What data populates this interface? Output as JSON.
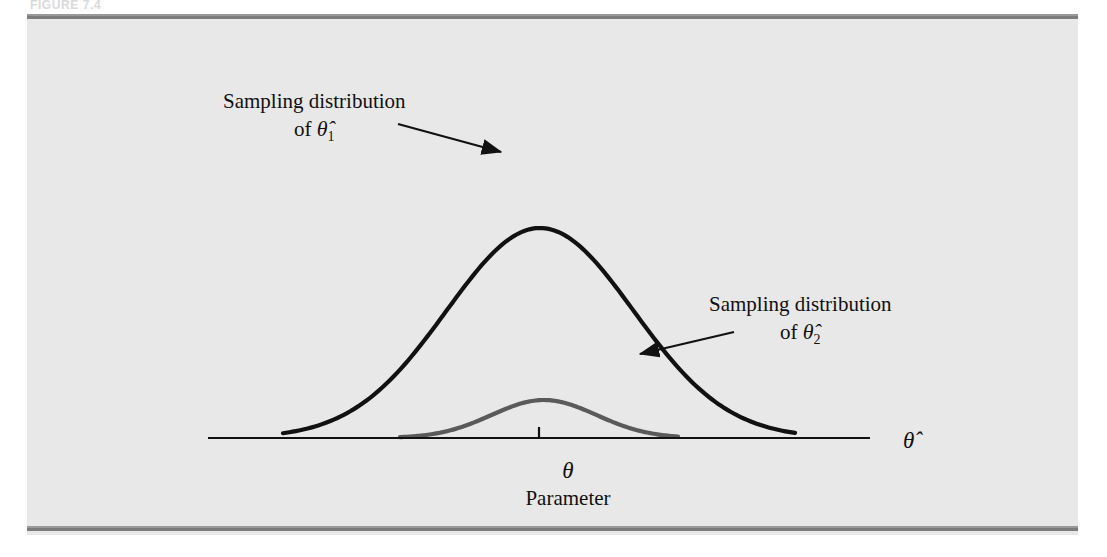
{
  "figure": {
    "caption_strip": "FIGURE 7.4",
    "panel_background": "#e8e8e8",
    "rule_color": "#7c7c7c",
    "page_background": "#ffffff"
  },
  "labels": {
    "estimator_1": {
      "line1": "Sampling distribution",
      "line2_prefix": "of ",
      "line2_symbol": "θ̂",
      "line2_subscript": "1"
    },
    "estimator_2": {
      "line1": "Sampling distribution",
      "line2_prefix": "of ",
      "line2_symbol": "θ̂",
      "line2_subscript": "2"
    },
    "axis_variable": "θ̂",
    "parameter_symbol": "θ",
    "parameter_name": "Parameter"
  },
  "chart_data": {
    "type": "line",
    "xlabel": "Parameter",
    "ylabel": "",
    "grid": false,
    "legend": "annotations",
    "axis": {
      "x_start_px": 181,
      "x_end_px": 843,
      "baseline_px": 424,
      "tick_x_px": 512,
      "tick_label": "θ",
      "tick_height_px": 11,
      "arrow_head": false,
      "color": "#111111",
      "width_px": 2.2
    },
    "series": [
      {
        "name": "Sampling distribution of θ̂1",
        "label_subscript": "1",
        "color": "#5a5a5a",
        "stroke_width_px": 4.2,
        "mean": 0,
        "sd": 1,
        "relative_sd": 0.55,
        "peak_height_px": 386,
        "peak_x_px": 517,
        "x_left_px": 373,
        "x_right_px": 651,
        "description": "narrow, tall gray curve — smaller variance, more efficient estimator"
      },
      {
        "name": "Sampling distribution of θ̂2",
        "label_subscript": "2",
        "color": "#111111",
        "stroke_width_px": 4.2,
        "mean": 0,
        "sd": 1.85,
        "relative_sd": 1.0,
        "peak_height_px": 214,
        "peak_x_px": 513,
        "x_left_px": 256,
        "x_right_px": 768,
        "description": "wide, flat black curve — larger variance, less efficient estimator"
      }
    ],
    "annotations": [
      {
        "text": "Sampling distribution of θ̂1",
        "arrow_from_px": [
          371,
          110
        ],
        "arrow_to_px": [
          474,
          138
        ],
        "target_series": 0
      },
      {
        "text": "Sampling distribution of θ̂2",
        "arrow_from_px": [
          707,
          318
        ],
        "arrow_to_px": [
          613,
          340
        ],
        "target_series": 1
      }
    ]
  }
}
